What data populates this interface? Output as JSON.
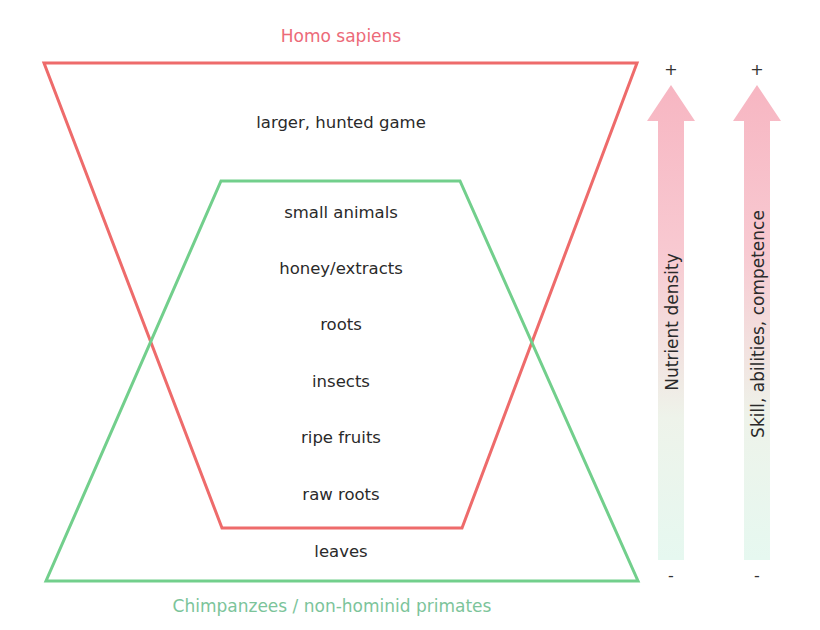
{
  "diagram": {
    "type": "overlapping-trapezoids-with-gradient-axes",
    "top_label": "Homo sapiens",
    "bottom_label": "Chimpanzees / non-hominid primates",
    "food_items": [
      "larger, hunted game",
      "small animals",
      "honey/extracts",
      "roots",
      "insects",
      "ripe fruits",
      "raw roots",
      "leaves"
    ],
    "axes": [
      {
        "label": "Nutrient density",
        "top_sign": "+",
        "bottom_sign": "-"
      },
      {
        "label": "Skill, abilities, competence",
        "top_sign": "+",
        "bottom_sign": "-"
      }
    ],
    "colors": {
      "homo_sapiens_shape": "#ee6b6b",
      "homo_sapiens_text": "#ec6a78",
      "chimpanzee_shape": "#72cf8c",
      "chimpanzee_text": "#7cc49a",
      "arrow_top": "#f7b8c4",
      "arrow_bottom": "#e8f8f0",
      "text": "#2a2a2a"
    }
  }
}
